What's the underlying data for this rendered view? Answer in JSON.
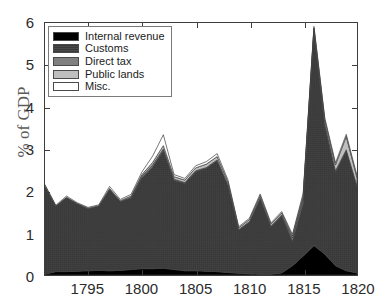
{
  "chart_data": {
    "type": "area",
    "stacked": true,
    "title": "",
    "subtitle": "",
    "xlabel": "",
    "ylabel": "% of GDP",
    "xlim": [
      1791,
      1820
    ],
    "ylim": [
      0,
      6
    ],
    "yticks": [
      0,
      1,
      2,
      3,
      4,
      5,
      6
    ],
    "ytick_labels": [
      "0",
      "1",
      "2",
      "3",
      "4",
      "5",
      "6"
    ],
    "xticks": [
      1795,
      1800,
      1805,
      1810,
      1815,
      1820
    ],
    "xtick_labels": [
      "1795",
      "1800",
      "1805",
      "1810",
      "1815",
      "1820"
    ],
    "grid": false,
    "legend_position": "top-left",
    "x": [
      1791,
      1792,
      1793,
      1794,
      1795,
      1796,
      1797,
      1798,
      1799,
      1800,
      1801,
      1802,
      1803,
      1804,
      1805,
      1806,
      1807,
      1808,
      1809,
      1810,
      1811,
      1812,
      1813,
      1814,
      1815,
      1816,
      1817,
      1818,
      1819,
      1820
    ],
    "series": [
      {
        "name": "Internal revenue",
        "color": "#000000",
        "values": [
          0.02,
          0.08,
          0.08,
          0.09,
          0.1,
          0.11,
          0.1,
          0.11,
          0.13,
          0.15,
          0.15,
          0.16,
          0.13,
          0.1,
          0.1,
          0.09,
          0.08,
          0.06,
          0.04,
          0.03,
          0.02,
          0.02,
          0.05,
          0.22,
          0.45,
          0.7,
          0.5,
          0.22,
          0.1,
          0.05
        ]
      },
      {
        "name": "Customs",
        "color": "#3a3a3a",
        "values": [
          2.1,
          1.56,
          1.77,
          1.61,
          1.48,
          1.53,
          1.94,
          1.64,
          1.7,
          2.16,
          2.42,
          2.8,
          2.12,
          2.08,
          2.36,
          2.45,
          2.64,
          2.08,
          1.03,
          1.23,
          1.8,
          1.13,
          1.36,
          0.58,
          1.25,
          5.05,
          3.05,
          2.22,
          2.85,
          2.05
        ]
      },
      {
        "name": "Direct tax",
        "color": "#808080",
        "values": [
          0.0,
          0.0,
          0.0,
          0.0,
          0.0,
          0.0,
          0.0,
          0.0,
          0.02,
          0.04,
          0.05,
          0.04,
          0.03,
          0.02,
          0.02,
          0.02,
          0.02,
          0.01,
          0.01,
          0.01,
          0.01,
          0.01,
          0.02,
          0.08,
          0.12,
          0.06,
          0.05,
          0.04,
          0.03,
          0.02
        ]
      },
      {
        "name": "Public lands",
        "color": "#bfbfbf",
        "values": [
          0.0,
          0.0,
          0.0,
          0.0,
          0.01,
          0.01,
          0.02,
          0.02,
          0.03,
          0.04,
          0.06,
          0.08,
          0.06,
          0.06,
          0.07,
          0.08,
          0.08,
          0.07,
          0.04,
          0.05,
          0.06,
          0.05,
          0.05,
          0.05,
          0.07,
          0.07,
          0.1,
          0.14,
          0.32,
          0.2
        ]
      },
      {
        "name": "Misc.",
        "color": "#ffffff",
        "values": [
          0.03,
          0.02,
          0.03,
          0.02,
          0.02,
          0.02,
          0.05,
          0.03,
          0.04,
          0.06,
          0.15,
          0.26,
          0.05,
          0.04,
          0.05,
          0.06,
          0.07,
          0.05,
          0.03,
          0.03,
          0.04,
          0.03,
          0.03,
          0.04,
          0.06,
          0.04,
          0.05,
          0.05,
          0.05,
          0.05
        ]
      }
    ],
    "annotations": []
  },
  "legend": {
    "items": [
      {
        "label": "Internal revenue",
        "color": "#000000"
      },
      {
        "label": "Customs",
        "color": "#3a3a3a"
      },
      {
        "label": "Direct tax",
        "color": "#808080"
      },
      {
        "label": "Public lands",
        "color": "#bfbfbf"
      },
      {
        "label": "Misc.",
        "color": "#ffffff"
      }
    ]
  },
  "axes": {
    "y_title": "% of GDP",
    "y_tick_labels": [
      "0",
      "1",
      "2",
      "3",
      "4",
      "5",
      "6"
    ],
    "x_tick_labels": [
      "1795",
      "1800",
      "1805",
      "1810",
      "1815",
      "1820"
    ]
  },
  "style": {
    "frame_color": "#3d3d3d",
    "background": "#ffffff",
    "y_title_color": "#5b5b5b",
    "tick_label_color": "#2b2b2b"
  }
}
